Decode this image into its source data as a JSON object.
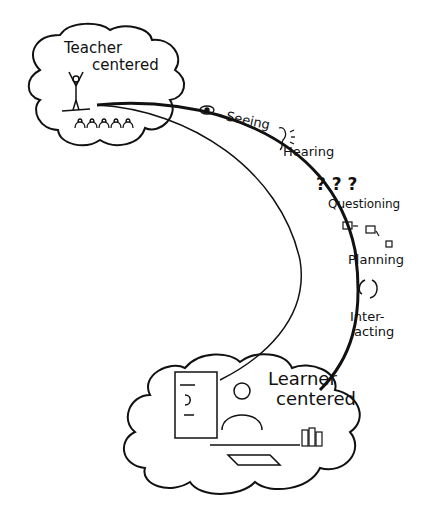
{
  "diagram": {
    "start_node": {
      "line1": "Teacher",
      "line2": "centered"
    },
    "end_node": {
      "line1": "Learner",
      "line2": "centered"
    },
    "path_steps": [
      {
        "label": "Seeing",
        "icon": "eye-icon"
      },
      {
        "label": "Hearing",
        "icon": "ear-icon"
      },
      {
        "label": "Questioning",
        "icon": "question-marks-icon"
      },
      {
        "label": "Planning",
        "icon": "flow-boxes-icon"
      },
      {
        "label": "Inter-",
        "label2": "acting",
        "icon": "cycle-arrows-icon"
      }
    ],
    "colors": {
      "ink": "#111111",
      "background": "#ffffff"
    }
  }
}
